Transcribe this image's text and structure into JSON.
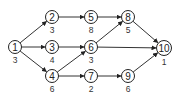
{
  "diagram": {
    "type": "directed-network",
    "nodes": [
      {
        "id": "1",
        "x": 15,
        "y": 47,
        "weight": "3"
      },
      {
        "id": "2",
        "x": 52,
        "y": 17,
        "weight": "3"
      },
      {
        "id": "3",
        "x": 52,
        "y": 47,
        "weight": "4"
      },
      {
        "id": "4",
        "x": 52,
        "y": 76,
        "weight": "6"
      },
      {
        "id": "5",
        "x": 91,
        "y": 17,
        "weight": "8"
      },
      {
        "id": "6",
        "x": 91,
        "y": 47,
        "weight": "3"
      },
      {
        "id": "7",
        "x": 91,
        "y": 76,
        "weight": "2"
      },
      {
        "id": "8",
        "x": 128,
        "y": 17,
        "weight": "5"
      },
      {
        "id": "9",
        "x": 128,
        "y": 76,
        "weight": "6"
      },
      {
        "id": "10",
        "x": 164,
        "y": 48,
        "weight": "1"
      }
    ],
    "edges": [
      {
        "from": "1",
        "to": "2"
      },
      {
        "from": "1",
        "to": "3"
      },
      {
        "from": "1",
        "to": "4"
      },
      {
        "from": "2",
        "to": "5"
      },
      {
        "from": "3",
        "to": "6"
      },
      {
        "from": "4",
        "to": "6"
      },
      {
        "from": "4",
        "to": "7"
      },
      {
        "from": "5",
        "to": "8"
      },
      {
        "from": "6",
        "to": "8"
      },
      {
        "from": "6",
        "to": "10"
      },
      {
        "from": "8",
        "to": "10"
      },
      {
        "from": "7",
        "to": "9"
      },
      {
        "from": "9",
        "to": "10"
      }
    ],
    "colors": {
      "stroke": "#222222",
      "background": "#ffffff"
    }
  }
}
